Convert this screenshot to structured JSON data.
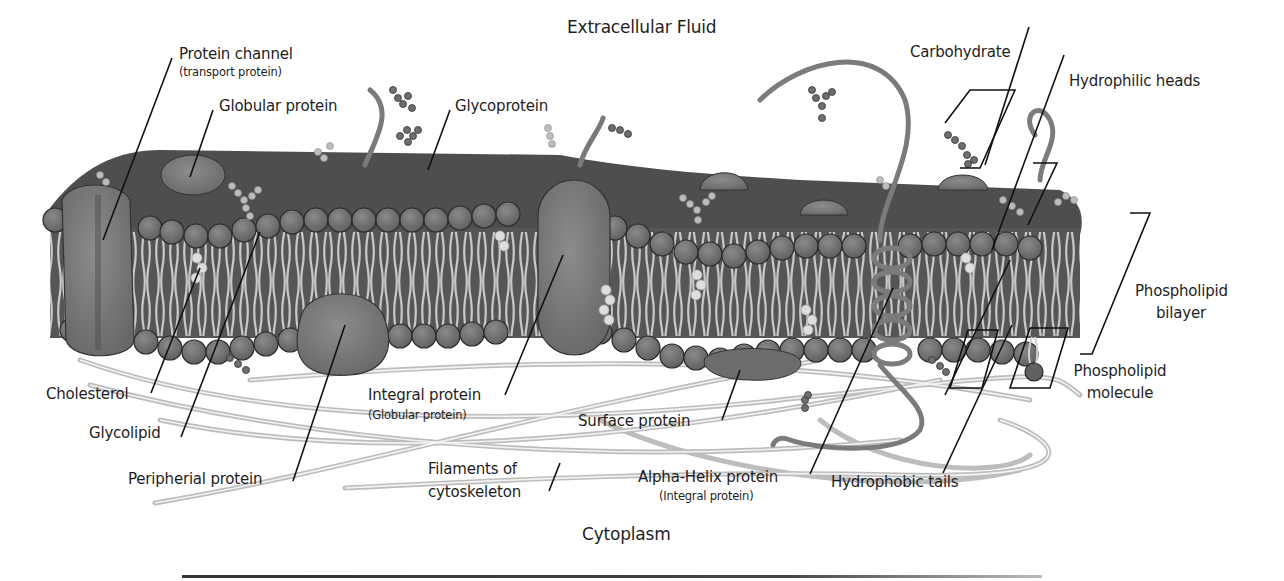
{
  "regions": {
    "top": "Extracellular Fluid",
    "bottom": "Cytoplasm"
  },
  "labels": {
    "protein_channel": "Protein channel",
    "protein_channel_sub": "(transport protein)",
    "globular_protein": "Globular protein",
    "glycoprotein": "Glycoprotein",
    "carbohydrate": "Carbohydrate",
    "hydrophilic_heads": "Hydrophilic heads",
    "phospholipid_bilayer_1": "Phospholipid",
    "phospholipid_bilayer_2": "bilayer",
    "phospholipid_molecule_1": "Phospholipid",
    "phospholipid_molecule_2": "molecule",
    "cholesterol": "Cholesterol",
    "glycolipid": "Glycolipid",
    "peripheral_protein": "Peripherial protein",
    "integral_protein": "Integral protein",
    "integral_protein_sub": "(Globular protein)",
    "surface_protein": "Surface protein",
    "filaments_1": "Filaments of",
    "filaments_2": "cytoskeleton",
    "alpha_helix": "Alpha-Helix protein",
    "alpha_helix_sub": "(Integral protein)",
    "hydrophobic_tails": "Hydrophobic tails"
  },
  "colors": {
    "background": "#ffffff",
    "head_fill": "#6e6e6e",
    "head_stroke": "#2a2a2a",
    "membrane_core": "#5a5a5a",
    "protein_fill": "#7a7a7a",
    "tail": "#c8c8c8",
    "cholesterol": "#dcdcdc",
    "filament": "#bdbdbd",
    "leader_line": "#111111"
  }
}
